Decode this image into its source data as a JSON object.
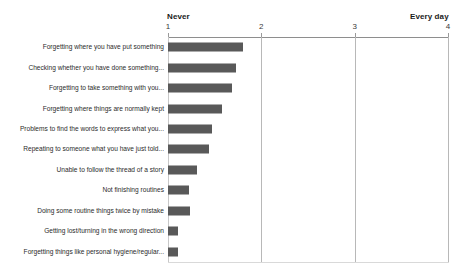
{
  "chart_data": {
    "type": "bar",
    "orientation": "horizontal",
    "title": "",
    "subtitle": "",
    "xlabel": "",
    "ylabel": "",
    "xlim": [
      1,
      4
    ],
    "grid": true,
    "legend": null,
    "axis_labels": {
      "min": "Never",
      "max": "Every day"
    },
    "ticks": [
      {
        "value": 1,
        "label": "1"
      },
      {
        "value": 2,
        "label": "2"
      },
      {
        "value": 3,
        "label": "3"
      },
      {
        "value": 4,
        "label": "4"
      }
    ],
    "bar_color": "#595959",
    "categories": [
      "Forgetting where you have put something",
      "Checking whether you have done something...",
      "Forgetting to take something with you...",
      "Forgetting where things are normally kept",
      "Problems to find the words to express what you...",
      "Repeating to someone what you have just told...",
      "Unable to follow the thread of a story",
      "Not finishing routines",
      "Doing some routine things twice by mistake",
      "Getting lost/turning in the wrong direction",
      "Forgetting things like personal hygiene/regular..."
    ],
    "values": [
      1.8,
      1.73,
      1.69,
      1.58,
      1.47,
      1.44,
      1.31,
      1.23,
      1.24,
      1.11,
      1.11
    ]
  }
}
